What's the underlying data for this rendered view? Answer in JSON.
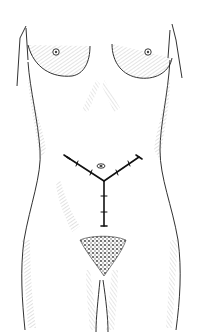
{
  "illustration": {
    "subject": "anterior-female-torso",
    "style": "pen-and-ink line drawing",
    "annotation": "Y-shaped abdominal incision line with cross-hatch tick marks",
    "colors": {
      "background": "#ffffff",
      "ink": "#1a1a1a",
      "hatch": "#8a8a8a",
      "incision": "#111111"
    }
  }
}
